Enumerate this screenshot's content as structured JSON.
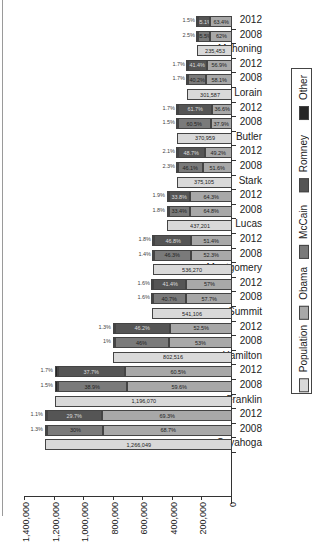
{
  "chart_data": {
    "type": "bar",
    "orientation": "horizontal-stacked, rotated 90deg",
    "title": "",
    "xlabel": "",
    "ylabel": "",
    "value_axis": {
      "range": [
        0,
        1400000
      ],
      "ticks": [
        "0",
        "200,000",
        "400,000",
        "600,000",
        "800,000",
        "1,000,000",
        "1,200,000",
        "1,400,000"
      ]
    },
    "legend": {
      "position": "right",
      "entries": [
        {
          "name": "Population",
          "color": "#d9d9d9"
        },
        {
          "name": "Obama",
          "color": "#a8a8a8"
        },
        {
          "name": "McCain",
          "color": "#7a7a7a"
        },
        {
          "name": "Romney",
          "color": "#555555"
        },
        {
          "name": "Other",
          "color": "#262626"
        }
      ]
    },
    "counties": [
      {
        "name": "Cuyahoga",
        "population": 1266049,
        "population_label": "1,266,049",
        "elections": [
          {
            "year": "2008",
            "obama": "68.7%",
            "rep": "30%",
            "rep_name": "McCain",
            "other": "1.3%",
            "obama_pct": 68.7,
            "rep_pct": 30.0,
            "other_pct": 1.3
          },
          {
            "year": "2012",
            "obama": "69.3%",
            "rep": "29.7%",
            "rep_name": "Romney",
            "other": "1.1%",
            "obama_pct": 69.3,
            "rep_pct": 29.7,
            "other_pct": 1.1
          }
        ]
      },
      {
        "name": "Franklin",
        "population": 1196070,
        "population_label": "1,196,070",
        "elections": [
          {
            "year": "2008",
            "obama": "59.6%",
            "rep": "38.9%",
            "rep_name": "McCain",
            "other": "1.5%",
            "obama_pct": 59.6,
            "rep_pct": 38.9,
            "other_pct": 1.5
          },
          {
            "year": "2012",
            "obama": "60.5%",
            "rep": "37.7%",
            "rep_name": "Romney",
            "other": "1.7%",
            "obama_pct": 60.5,
            "rep_pct": 37.7,
            "other_pct": 1.7
          }
        ]
      },
      {
        "name": "Hamilton",
        "population": 802516,
        "population_label": "802,516",
        "elections": [
          {
            "year": "2008",
            "obama": "53%",
            "rep": "46%",
            "rep_name": "McCain",
            "other": "1%",
            "obama_pct": 53.0,
            "rep_pct": 46.0,
            "other_pct": 1.0
          },
          {
            "year": "2012",
            "obama": "52.5%",
            "rep": "46.2%",
            "rep_name": "Romney",
            "other": "1.3%",
            "obama_pct": 52.5,
            "rep_pct": 46.2,
            "other_pct": 1.3
          }
        ]
      },
      {
        "name": "Summit",
        "population": 541106,
        "population_label": "541,106",
        "elections": [
          {
            "year": "2008",
            "obama": "57.7%",
            "rep": "40.7%",
            "rep_name": "McCain",
            "other": "1.6%",
            "obama_pct": 57.7,
            "rep_pct": 40.7,
            "other_pct": 1.6
          },
          {
            "year": "2012",
            "obama": "57%",
            "rep": "41.4%",
            "rep_name": "Romney",
            "other": "1.6%",
            "obama_pct": 57.0,
            "rep_pct": 41.4,
            "other_pct": 1.6
          }
        ]
      },
      {
        "name": "Montgomery",
        "population": 536270,
        "population_label": "536,270",
        "elections": [
          {
            "year": "2008",
            "obama": "52.3%",
            "rep": "46.3%",
            "rep_name": "McCain",
            "other": "1.4%",
            "obama_pct": 52.3,
            "rep_pct": 46.3,
            "other_pct": 1.4
          },
          {
            "year": "2012",
            "obama": "51.4%",
            "rep": "46.8%",
            "rep_name": "Romney",
            "other": "1.8%",
            "obama_pct": 51.4,
            "rep_pct": 46.8,
            "other_pct": 1.8
          }
        ]
      },
      {
        "name": "Lucas",
        "population": 437201,
        "population_label": "437,201",
        "elections": [
          {
            "year": "2008",
            "obama": "64.8%",
            "rep": "33.4%",
            "rep_name": "McCain",
            "other": "1.8%",
            "obama_pct": 64.8,
            "rep_pct": 33.4,
            "other_pct": 1.8
          },
          {
            "year": "2012",
            "obama": "64.3%",
            "rep": "33.8%",
            "rep_name": "Romney",
            "other": "1.9%",
            "obama_pct": 64.3,
            "rep_pct": 33.8,
            "other_pct": 1.9
          }
        ]
      },
      {
        "name": "Stark",
        "population": 375105,
        "population_label": "375,105",
        "elections": [
          {
            "year": "2008",
            "obama": "51.6%",
            "rep": "46.1%",
            "rep_name": "McCain",
            "other": "2.3%",
            "obama_pct": 51.6,
            "rep_pct": 46.1,
            "other_pct": 2.3
          },
          {
            "year": "2012",
            "obama": "49.2%",
            "rep": "48.7%",
            "rep_name": "Romney",
            "other": "2.1%",
            "obama_pct": 49.2,
            "rep_pct": 48.7,
            "other_pct": 2.1
          }
        ]
      },
      {
        "name": "Butler",
        "population": 370959,
        "population_label": "370,959",
        "elections": [
          {
            "year": "2008",
            "obama": "37.9%",
            "rep": "60.5%",
            "rep_name": "McCain",
            "other": "1.5%",
            "obama_pct": 37.9,
            "rep_pct": 60.5,
            "other_pct": 1.5
          },
          {
            "year": "2012",
            "obama": "36.6%",
            "rep": "61.7%",
            "rep_name": "Romney",
            "other": "1.7%",
            "obama_pct": 36.6,
            "rep_pct": 61.7,
            "other_pct": 1.7
          }
        ]
      },
      {
        "name": "Lorain",
        "population": 301587,
        "population_label": "301,587",
        "elections": [
          {
            "year": "2008",
            "obama": "58.1%",
            "rep": "40.2%",
            "rep_name": "McCain",
            "other": "1.7%",
            "obama_pct": 58.1,
            "rep_pct": 40.2,
            "other_pct": 1.7
          },
          {
            "year": "2012",
            "obama": "56.9%",
            "rep": "41.4%",
            "rep_name": "Romney",
            "other": "1.7%",
            "obama_pct": 56.9,
            "rep_pct": 41.4,
            "other_pct": 1.7
          }
        ]
      },
      {
        "name": "Mahoning",
        "population": 235453,
        "population_label": "235,453",
        "elections": [
          {
            "year": "2008",
            "obama": "62%",
            "rep": "35.5%",
            "rep_name": "McCain",
            "other": "2.5%",
            "obama_pct": 62.0,
            "rep_pct": 35.5,
            "other_pct": 2.5
          },
          {
            "year": "2012",
            "obama": "63.4%",
            "rep": "35.1%",
            "rep_name": "Romney",
            "other": "1.5%",
            "obama_pct": 63.4,
            "rep_pct": 35.1,
            "other_pct": 1.5
          }
        ]
      }
    ]
  },
  "colors": {
    "population": "#d9d9d9",
    "obama": "#a8a8a8",
    "mccain": "#7a7a7a",
    "romney": "#555555",
    "other": "#262626"
  }
}
